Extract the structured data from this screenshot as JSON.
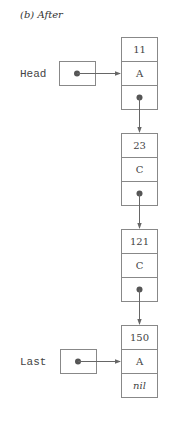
{
  "title": "(b)  After",
  "pointers": {
    "head": {
      "label": "Head"
    },
    "last": {
      "label": "Last"
    }
  },
  "nodes": [
    {
      "key": "11",
      "value": "A",
      "next": "pointer"
    },
    {
      "key": "23",
      "value": "C",
      "next": "pointer"
    },
    {
      "key": "121",
      "value": "C",
      "next": "pointer"
    },
    {
      "key": "150",
      "value": "A",
      "next": "nil"
    }
  ],
  "colors": {
    "box_stroke": "#888888",
    "dot": "#555555",
    "line": "#666666",
    "text": "#444444"
  }
}
